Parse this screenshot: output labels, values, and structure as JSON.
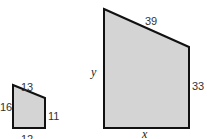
{
  "colors": {
    "fill": "#d4d4d4",
    "stroke": "#111111"
  },
  "small_shape": {
    "top_label": "13",
    "left_label": "16",
    "right_label": "11",
    "bottom_label": "12"
  },
  "large_shape": {
    "top_label": "39",
    "left_label": "y",
    "right_label": "33",
    "bottom_label": "x"
  }
}
